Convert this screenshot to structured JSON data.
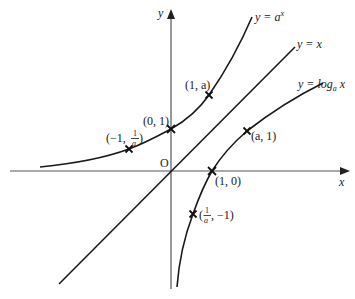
{
  "diagram": {
    "axes": {
      "x_label": "x",
      "y_label": "y",
      "origin_label": "O"
    },
    "curves": [
      {
        "id": "exp",
        "label_prefix": "y = a",
        "label_sup": "x",
        "description": "exponential curve y = a^x"
      },
      {
        "id": "identity",
        "label": "y = x",
        "description": "line y = x (mirror line)"
      },
      {
        "id": "log",
        "label_prefix": "y = log",
        "label_sub": "a",
        "label_suffix": " x",
        "description": "logarithmic curve y = log_a x"
      }
    ],
    "points": {
      "p_0_1": "(0, 1)",
      "p_1_a": "(1, a)",
      "p_m1_inv_a": {
        "open": "(−1, ",
        "num": "1",
        "den": "a",
        "close": ")"
      },
      "p_a_1": "(a, 1)",
      "p_1_0": "(1, 0)",
      "p_inv_a_m1": {
        "open": "(",
        "num": "1",
        "den": "a",
        "close": ", −1)"
      }
    },
    "colors": {
      "curve": "#1a1a1a",
      "axis": "#555555",
      "background": "#ffffff"
    }
  }
}
